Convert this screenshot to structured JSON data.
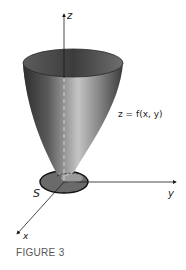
{
  "figure": {
    "caption": "FIGURE 3",
    "labels": {
      "z_axis": "z",
      "y_axis": "y",
      "x_axis": "x",
      "region": "S",
      "surface": "z = f(x, y)"
    },
    "colors": {
      "surface_dark": "#3a3a3a",
      "surface_light": "#b8b8b8",
      "region_fill": "#6a6a6a",
      "axis": "#1a1a1a",
      "caption": "#555555"
    }
  }
}
